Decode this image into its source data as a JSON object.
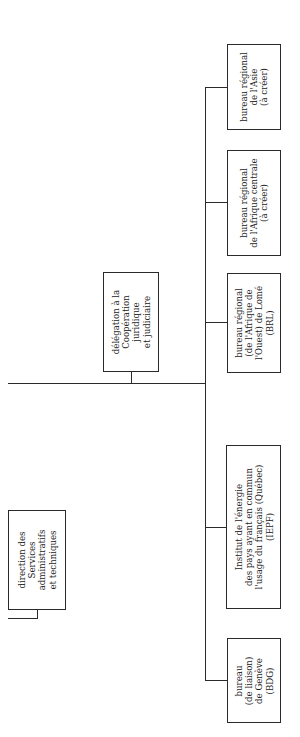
{
  "orgchart": {
    "nodes": [
      {
        "id": "asie",
        "lines": [
          "bureau régional",
          "de l'Asie",
          "(à créer)"
        ]
      },
      {
        "id": "afrique-centrale",
        "lines": [
          "bureau régional",
          "de l'Afrique centrale",
          "(à créer)"
        ]
      },
      {
        "id": "lome",
        "lines": [
          "bureau régional",
          "(de l'Afrique de",
          "l'Ouest) de Lomé",
          "(BRL)"
        ]
      },
      {
        "id": "iepf",
        "lines": [
          "Institut de l'énergie",
          "des pays ayant en commun",
          "l'usage du français (Québec)",
          "(IEPF)"
        ]
      },
      {
        "id": "geneve",
        "lines": [
          "bureau",
          "(de liaison)",
          "de Genève",
          "(BDG)"
        ]
      },
      {
        "id": "delegation",
        "lines": [
          "délégation à la",
          "Coopération",
          "juridique",
          "et judiciaire"
        ]
      },
      {
        "id": "direction",
        "lines": [
          "direction des",
          "Services",
          "administratifs",
          "et techniques"
        ]
      }
    ],
    "colors": {
      "line": "#2a2a2a",
      "text": "#1a1a1a",
      "background": "#ffffff"
    }
  }
}
